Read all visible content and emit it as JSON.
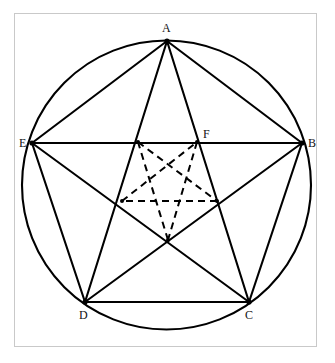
{
  "figure": {
    "canvas": {
      "width": 335,
      "height": 363
    },
    "frame": {
      "x": 14,
      "y": 13,
      "width": 303,
      "height": 334,
      "stroke": "#c9c9c9",
      "stroke_width": 1
    },
    "background_color": "#ffffff",
    "stroke_color": "#000000",
    "solid_stroke_width": 2.1,
    "dashed_stroke_width": 2.0,
    "dash_pattern": "7,5",
    "circle": {
      "cx": 166.5,
      "cy": 185,
      "r": 144.5
    },
    "outer_vertices": [
      {
        "id": "A",
        "label": "A",
        "x": 167,
        "y": 41,
        "label_x": 162,
        "label_y": 22
      },
      {
        "id": "B",
        "label": "B",
        "x": 302,
        "y": 143,
        "label_x": 308,
        "label_y": 137
      },
      {
        "id": "C",
        "label": "C",
        "x": 249,
        "y": 302,
        "label_x": 245,
        "label_y": 309
      },
      {
        "id": "D",
        "label": "D",
        "x": 85,
        "y": 302,
        "label_x": 79,
        "label_y": 309
      },
      {
        "id": "E",
        "label": "E",
        "x": 32,
        "y": 143,
        "label_x": 19,
        "label_y": 137
      }
    ],
    "inner_vertices": [
      {
        "id": "F",
        "label": "F",
        "x": 197,
        "y": 142,
        "label_x": 203,
        "label_y": 128,
        "labeled": true
      },
      {
        "id": "I2",
        "label": "",
        "x": 217,
        "y": 201,
        "labeled": false
      },
      {
        "id": "I3",
        "label": "",
        "x": 168,
        "y": 240,
        "labeled": false
      },
      {
        "id": "I4",
        "label": "",
        "x": 122,
        "y": 201,
        "labeled": false
      },
      {
        "id": "I5",
        "label": "",
        "x": 138,
        "y": 142,
        "labeled": false
      }
    ],
    "pentagon_edges": [
      [
        "A",
        "B"
      ],
      [
        "B",
        "C"
      ],
      [
        "C",
        "D"
      ],
      [
        "D",
        "E"
      ],
      [
        "E",
        "A"
      ]
    ],
    "pentagram_diagonals": [
      [
        "A",
        "C"
      ],
      [
        "C",
        "E"
      ],
      [
        "E",
        "B"
      ],
      [
        "B",
        "D"
      ],
      [
        "D",
        "A"
      ]
    ],
    "inner_pentagram_diagonals": [
      [
        "F",
        "I3"
      ],
      [
        "I3",
        "I5"
      ],
      [
        "I5",
        "I2"
      ],
      [
        "I2",
        "I4"
      ],
      [
        "I4",
        "F"
      ]
    ],
    "labels_text": {
      "A": "A",
      "B": "B",
      "C": "C",
      "D": "D",
      "E": "E",
      "F": "F"
    }
  }
}
